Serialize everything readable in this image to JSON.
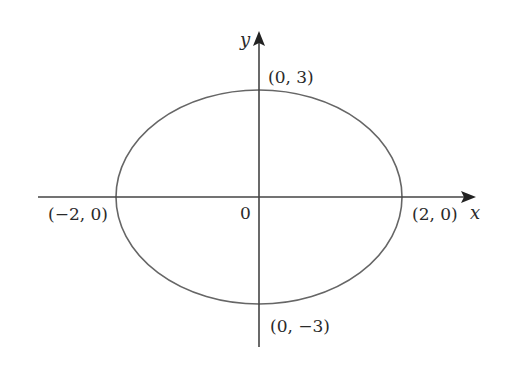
{
  "diagram": {
    "type": "ellipse",
    "equation_params": {
      "a": 2,
      "b": 3,
      "center": [
        0,
        0
      ]
    },
    "axes": {
      "x_label": "x",
      "y_label": "y"
    },
    "origin_label": "0",
    "points": {
      "top": "(0, 3)",
      "bottom": "(0, −3)",
      "left": "(−2, 0)",
      "right": "(2, 0)"
    },
    "colors": {
      "stroke": "#555555",
      "axis": "#444444",
      "text": "#2a2a2a"
    }
  }
}
